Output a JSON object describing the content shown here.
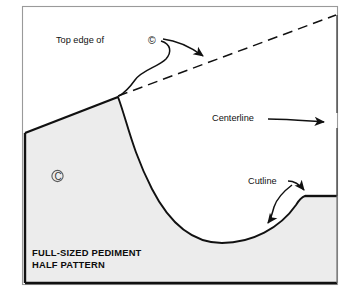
{
  "figure": {
    "kind": "technical-pattern-diagram",
    "background_color": "#ffffff",
    "pattern_fill_color": "#ececec",
    "line_color": "#111111",
    "outer_frame_color": "#9a9a9a"
  },
  "labels": {
    "top_edge": "Top edge of",
    "top_edge_symbol": "©",
    "centerline": "Centerline",
    "cutline": "Cutline",
    "title_line1": "FULL-SIZED PEDIMENT",
    "title_line2": "HALF PATTERN",
    "pattern_symbol": "©"
  },
  "geometry": {
    "frame": {
      "x": 22,
      "y": 6,
      "width": 316,
      "height": 279
    },
    "apex": {
      "x": 337,
      "y": 15
    },
    "pattern_peak": {
      "x": 118,
      "y": 97
    },
    "pattern_left_top": {
      "x": 25,
      "y": 133
    },
    "pattern_bottom": {
      "y": 283
    },
    "step_corner": {
      "x": 305,
      "y": 196
    },
    "curve_low_point": {
      "x": 222,
      "y": 243
    },
    "centerline_x": 337,
    "dashed_top_edge": {
      "from_x": 118,
      "from_y": 97,
      "to_x": 337,
      "to_y": 15
    }
  },
  "annotations": [
    {
      "name": "top-edge-callout",
      "text": "Top edge of ©",
      "arrow_target": "dashed top edge line"
    },
    {
      "name": "centerline-callout",
      "text": "Centerline",
      "arrow_target": "vertical centerline at right"
    },
    {
      "name": "cutline-callout",
      "text": "Cutline",
      "arrow_target": "curved cut edge of pattern"
    }
  ]
}
